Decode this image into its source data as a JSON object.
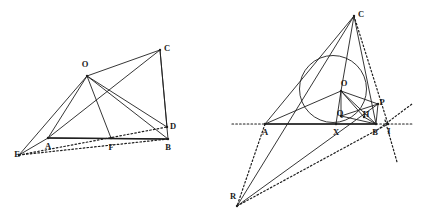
{
  "figure": {
    "background_color": "#ffffff",
    "ink_color": "#1f1f1f",
    "width": 424,
    "height": 219
  },
  "left_diagram": {
    "name": "quadrilateral-with-cevians",
    "points": [
      {
        "id": "E",
        "label": "E",
        "x": 19,
        "y": 155,
        "label_x": 17,
        "label_y": 155
      },
      {
        "id": "A",
        "label": "A",
        "x": 48,
        "y": 138,
        "label_x": 48,
        "label_y": 147
      },
      {
        "id": "F",
        "label": "F",
        "x": 111,
        "y": 138,
        "label_x": 111,
        "label_y": 148
      },
      {
        "id": "B",
        "label": "B",
        "x": 168,
        "y": 139,
        "label_x": 168,
        "label_y": 148
      },
      {
        "id": "D",
        "label": "D",
        "x": 167,
        "y": 127,
        "label_x": 173,
        "label_y": 127
      },
      {
        "id": "C",
        "label": "C",
        "x": 160,
        "y": 50,
        "label_x": 167,
        "label_y": 49
      },
      {
        "id": "O",
        "label": "O",
        "x": 87,
        "y": 76,
        "label_x": 85,
        "label_y": 65
      }
    ],
    "solid_segments": [
      [
        "E",
        "O"
      ],
      [
        "E",
        "A"
      ],
      [
        "A",
        "O"
      ],
      [
        "O",
        "C"
      ],
      [
        "O",
        "B"
      ],
      [
        "O",
        "D"
      ],
      [
        "O",
        "F"
      ],
      [
        "C",
        "B"
      ],
      [
        "C",
        "D"
      ],
      [
        "C",
        "A"
      ],
      [
        "A",
        "B"
      ]
    ],
    "thick_segments": [
      [
        "A",
        "B"
      ]
    ],
    "dotted_segments": [
      [
        "E",
        "B"
      ],
      [
        "E",
        "D"
      ]
    ]
  },
  "right_diagram": {
    "name": "triangle-with-incircle",
    "points": [
      {
        "id": "A",
        "label": "A",
        "x": 265,
        "y": 124,
        "label_x": 265,
        "label_y": 133
      },
      {
        "id": "X",
        "label": "X",
        "x": 336,
        "y": 124,
        "label_x": 336,
        "label_y": 133
      },
      {
        "id": "B",
        "label": "B",
        "x": 376,
        "y": 124,
        "label_x": 375,
        "label_y": 133
      },
      {
        "id": "I",
        "label": "I",
        "x": 388,
        "y": 124,
        "label_x": 389,
        "label_y": 132
      },
      {
        "id": "C",
        "label": "C",
        "x": 354,
        "y": 16,
        "label_x": 361,
        "label_y": 15
      },
      {
        "id": "O",
        "label": "O",
        "x": 341,
        "y": 91,
        "label_x": 344,
        "label_y": 84
      },
      {
        "id": "Q",
        "label": "Q",
        "x": 341,
        "y": 116,
        "label_x": 340,
        "label_y": 114
      },
      {
        "id": "P",
        "label": "P",
        "x": 378,
        "y": 104,
        "label_x": 382,
        "label_y": 103
      },
      {
        "id": "H",
        "label": "H",
        "x": 364,
        "y": 117,
        "label_x": 366,
        "label_y": 115
      },
      {
        "id": "R",
        "label": "R",
        "x": 237,
        "y": 206,
        "label_x": 233,
        "label_y": 197
      }
    ],
    "incircle": {
      "cx": 333,
      "cy": 89,
      "r": 33.5
    },
    "solid_segments": [
      [
        "A",
        "C"
      ],
      [
        "C",
        "B"
      ],
      [
        "A",
        "B"
      ],
      [
        "A",
        "O"
      ],
      [
        "O",
        "C"
      ],
      [
        "O",
        "B"
      ],
      [
        "O",
        "X"
      ],
      [
        "O",
        "Q"
      ],
      [
        "O",
        "H"
      ],
      [
        "O",
        "P"
      ],
      [
        "B",
        "P"
      ],
      [
        "Q",
        "P"
      ],
      [
        "Q",
        "B"
      ],
      [
        "H",
        "B"
      ],
      [
        "R",
        "C"
      ],
      [
        "R",
        "P"
      ]
    ],
    "thick_segments": [
      [
        "A",
        "B"
      ]
    ],
    "dotted_segments": [
      [
        "C",
        "I"
      ],
      [
        "R",
        "I"
      ],
      [
        "A",
        "R"
      ]
    ],
    "dotted_rays": [
      {
        "name": "baseline-left-extension",
        "x1": 232,
        "y1": 124,
        "x2": 265,
        "y2": 124
      },
      {
        "name": "baseline-right-extension",
        "x1": 376,
        "y1": 124,
        "x2": 412,
        "y2": 124
      },
      {
        "name": "tangent-through-I-up-right",
        "x1": 380,
        "y1": 128,
        "x2": 412,
        "y2": 104
      },
      {
        "name": "tangent-through-I-down",
        "x1": 385,
        "y1": 120,
        "x2": 397,
        "y2": 162
      }
    ]
  }
}
